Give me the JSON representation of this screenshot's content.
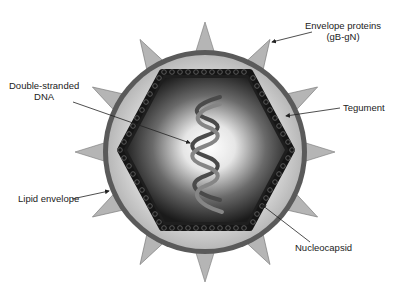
{
  "labels": {
    "envelope_proteins": {
      "line1": "Envelope proteins",
      "line2": "(gB-gN)"
    },
    "double_stranded_dna": {
      "line1": "Double-stranded",
      "line2": "DNA"
    },
    "tegument": "Tegument",
    "lipid_envelope": "Lipid envelope",
    "nucleocapsid": "Nucleocapsid"
  },
  "colors": {
    "envelope": "#5a5a5a",
    "tegument": "#c8c8c8",
    "spike": "#b4b4b4",
    "capsid_dark": "#1e1e1e",
    "dna": "#6a6a6a"
  }
}
